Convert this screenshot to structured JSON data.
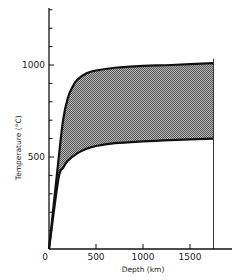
{
  "chart_data": {
    "type": "area",
    "title": "",
    "xlabel": "Depth (km)",
    "ylabel": "Temperature (°C)",
    "xlim": [
      0,
      1800
    ],
    "ylim": [
      0,
      1300
    ],
    "x_ticks": [
      0,
      500,
      1000,
      1500
    ],
    "x_tick_labels": [
      "0",
      "500",
      "1000",
      "1500"
    ],
    "y_ticks": [
      500,
      1000
    ],
    "y_tick_labels": [
      "500",
      "1000"
    ],
    "y_minor_tick_step": 100,
    "grid": false,
    "legend": null,
    "right_boundary_depth": 1750,
    "series": [
      {
        "name": "Upper bound",
        "x": [
          0,
          100,
          150,
          200,
          250,
          300,
          400,
          500,
          700,
          1000,
          1300,
          1750
        ],
        "values": [
          0,
          480,
          700,
          820,
          880,
          920,
          955,
          970,
          985,
          995,
          1000,
          1010
        ]
      },
      {
        "name": "Lower bound",
        "x": [
          0,
          100,
          150,
          200,
          300,
          400,
          500,
          700,
          1000,
          1300,
          1750
        ],
        "values": [
          0,
          380,
          440,
          480,
          520,
          545,
          560,
          575,
          585,
          592,
          600
        ]
      }
    ],
    "fill_between": [
      "Upper bound",
      "Lower bound"
    ],
    "fill_style": "stippled grey"
  }
}
